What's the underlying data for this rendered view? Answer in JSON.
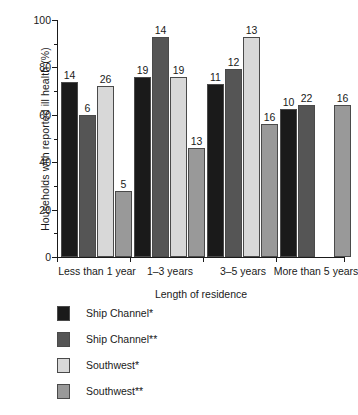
{
  "chart_data": {
    "type": "bar",
    "title": "",
    "xlabel": "Length of residence",
    "ylabel": "Households with reported ill health (%)",
    "ylim": [
      0,
      100
    ],
    "ytick_labels": [
      "0",
      "20",
      "40",
      "60",
      "80",
      "100"
    ],
    "ytick_values": [
      0,
      20,
      40,
      60,
      80,
      100
    ],
    "yminor_values": [
      10,
      30,
      50,
      70,
      90
    ],
    "grid": false,
    "legend_position": "below-left",
    "categories": [
      "Less than 1 year",
      "1–3 years",
      "3–5 years",
      "More than 5 years"
    ],
    "series": [
      {
        "name": "Ship Channel*",
        "color": "#1a1a1a",
        "values": [
          74,
          76,
          73,
          62.5
        ],
        "point_labels": [
          "14",
          "19",
          "11",
          "10"
        ]
      },
      {
        "name": "Ship Channel**",
        "color": "#555555",
        "values": [
          60,
          93,
          79.5,
          64
        ],
        "point_labels": [
          "6",
          "14",
          "12",
          "22"
        ]
      },
      {
        "name": "Southwest*",
        "color": "#d8d8d8",
        "values": [
          72,
          76,
          93,
          null
        ],
        "point_labels": [
          "26",
          "19",
          "13",
          null
        ]
      },
      {
        "name": "Southwest**",
        "color": "#999999",
        "values": [
          28,
          46,
          56,
          64
        ],
        "point_labels": [
          "5",
          "13",
          "16",
          "16"
        ]
      }
    ]
  },
  "legend": {
    "items": [
      {
        "label": "Ship Channel*",
        "color": "#1a1a1a"
      },
      {
        "label": "Ship Channel**",
        "color": "#555555"
      },
      {
        "label": "Southwest*",
        "color": "#d8d8d8"
      },
      {
        "label": "Southwest**",
        "color": "#999999"
      }
    ]
  }
}
